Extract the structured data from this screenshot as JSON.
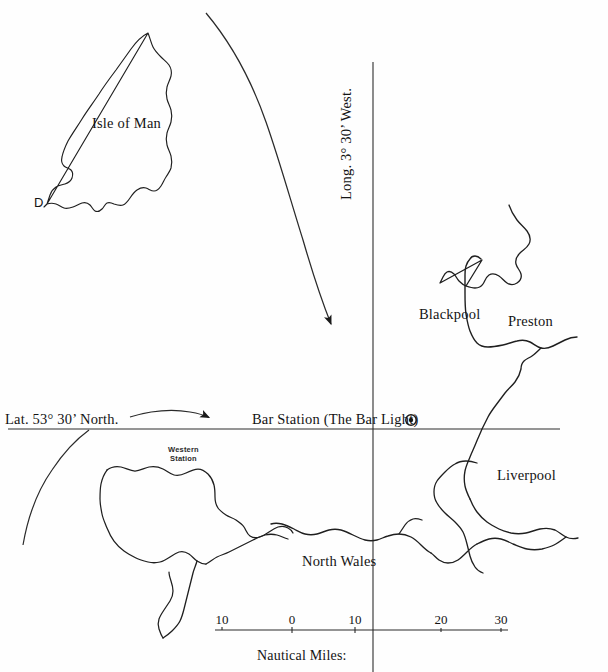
{
  "map": {
    "type": "nautical-chart",
    "region": "Irish Sea — Liverpool Bay approaches",
    "background_color": "#fefefe",
    "ink_color": "#1a1a1a",
    "graticule": {
      "latitude_label": "Lat. 53° 30’ North.",
      "longitude_label": "Long. 3° 30’ West."
    },
    "stations": {
      "bar_station_label": "Bar Station (The Bar Light)",
      "bar_light_symbol": "lighthouse-circle",
      "western_station_label_line1": "Western",
      "western_station_label_line2": "Station"
    },
    "place_labels": [
      {
        "name": "Isle of Man"
      },
      {
        "name": "Blackpool"
      },
      {
        "name": "Preston"
      },
      {
        "name": "Liverpool"
      },
      {
        "name": "North Wales"
      }
    ],
    "point_markers": [
      {
        "name": "D"
      }
    ],
    "scale": {
      "title": "Nautical Miles:",
      "ticks": [
        "10",
        "0",
        "10",
        "20",
        "30"
      ],
      "tick_x": [
        222,
        292,
        355,
        441,
        501
      ]
    }
  }
}
